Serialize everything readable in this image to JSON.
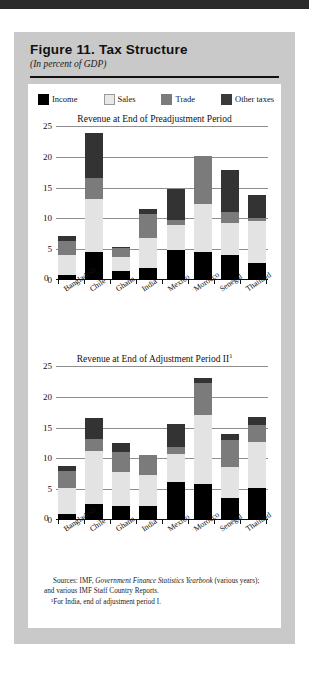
{
  "figure": {
    "title": "Figure 11.  Tax Structure",
    "subtitle": "(In percent of GDP)"
  },
  "legend": {
    "items": [
      {
        "label": "Income",
        "color": "#000000",
        "name": "income"
      },
      {
        "label": "Sales",
        "color": "#e3e3e3",
        "name": "sales"
      },
      {
        "label": "Trade",
        "color": "#7b7b7b",
        "name": "trade"
      },
      {
        "label": "Other taxes",
        "color": "#333333",
        "name": "other"
      }
    ]
  },
  "source": {
    "prefix": "Sources:  IMF, ",
    "italic": "Government Finance Statistics Yearbook",
    "suffix": " (various years); and various IMF Staff Country Reports.",
    "footnote": "¹For India, end of adjustment period I."
  },
  "chart_data": [
    {
      "type": "bar",
      "stacked": true,
      "title": "Revenue at End of Preadjustment Period",
      "title_sup": "",
      "xlabel": "",
      "ylabel": "",
      "ylim": [
        0,
        25
      ],
      "yticks": [
        0,
        5,
        10,
        15,
        20,
        25
      ],
      "ytick_labels": [
        "0",
        "5",
        "10",
        "15",
        "20",
        "25"
      ],
      "grid": true,
      "legend_position": "top",
      "categories": [
        "Bangladesh",
        "Chile",
        "Ghana",
        "India",
        "Mexico",
        "Morocco",
        "Senegal",
        "Thailand"
      ],
      "series": [
        {
          "name": "Income",
          "color": "#000000",
          "values": [
            0.8,
            4.5,
            1.5,
            1.9,
            4.9,
            4.6,
            4.0,
            2.8
          ]
        },
        {
          "name": "Sales",
          "color": "#e3e3e3",
          "values": [
            3.3,
            8.7,
            2.3,
            4.9,
            4.0,
            7.7,
            5.3,
            6.8
          ]
        },
        {
          "name": "Trade",
          "color": "#7b7b7b",
          "values": [
            2.2,
            3.4,
            1.4,
            3.9,
            0.8,
            7.8,
            1.7,
            0.4
          ]
        },
        {
          "name": "Other taxes",
          "color": "#333333",
          "values": [
            0.9,
            7.2,
            0.1,
            0.9,
            5.0,
            0.1,
            6.8,
            3.8
          ]
        }
      ],
      "totals": [
        7.2,
        23.8,
        5.3,
        10.8,
        14.7,
        20.2,
        17.8,
        13.8
      ]
    },
    {
      "type": "bar",
      "stacked": true,
      "title": "Revenue at End of Adjustment Period II",
      "title_sup": "1",
      "xlabel": "",
      "ylabel": "",
      "ylim": [
        0,
        25
      ],
      "yticks": [
        0,
        5,
        10,
        15,
        20,
        25
      ],
      "ytick_labels": [
        "0",
        "5",
        "10",
        "15",
        "20",
        "25"
      ],
      "grid": true,
      "legend_position": "top",
      "categories": [
        "Bangladesh",
        "Chile",
        "Ghana",
        "India",
        "Mexico",
        "Morocco",
        "Senegal",
        "Thailand"
      ],
      "series": [
        {
          "name": "Income",
          "color": "#000000",
          "values": [
            1.0,
            2.6,
            2.3,
            2.2,
            6.2,
            5.9,
            3.6,
            5.2
          ]
        },
        {
          "name": "Sales",
          "color": "#e3e3e3",
          "values": [
            4.2,
            8.6,
            5.5,
            5.1,
            4.5,
            11.1,
            5.0,
            7.5
          ]
        },
        {
          "name": "Trade",
          "color": "#7b7b7b",
          "values": [
            2.7,
            1.9,
            3.2,
            3.2,
            1.2,
            5.2,
            4.4,
            2.7
          ]
        },
        {
          "name": "Other taxes",
          "color": "#333333",
          "values": [
            0.9,
            3.5,
            1.5,
            0.1,
            3.7,
            0.8,
            1.0,
            1.4
          ]
        }
      ],
      "totals": [
        8.8,
        16.6,
        12.5,
        10.6,
        15.6,
        23.0,
        14.0,
        16.8
      ]
    }
  ]
}
